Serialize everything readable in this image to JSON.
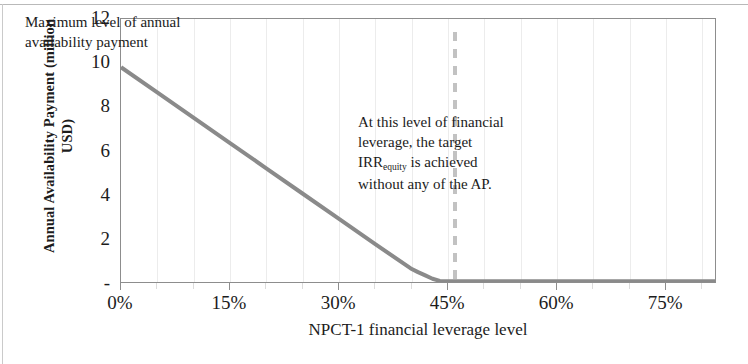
{
  "chart_data": {
    "type": "line",
    "title": "",
    "xlabel": "NPCT-1 financial leverage level",
    "ylabel": "Annual Availability Payment (million\nUSD)",
    "xlim": [
      0,
      82
    ],
    "ylim": [
      0,
      12
    ],
    "grid": true,
    "legend": "none",
    "x_tick_labels": [
      "0%",
      "15%",
      "30%",
      "45%",
      "60%",
      "75%"
    ],
    "x_tick_values": [
      0,
      15,
      30,
      45,
      60,
      75
    ],
    "y_tick_labels": [
      "12",
      "10",
      "8",
      "6",
      "4",
      "2",
      "-"
    ],
    "y_tick_values": [
      12,
      10,
      8,
      6,
      4,
      2,
      0
    ],
    "series": [
      {
        "name": "Annual availability payment",
        "color": "#8a8a8a",
        "x": [
          0,
          5,
          10,
          15,
          20,
          25,
          30,
          35,
          40,
          41,
          42,
          43,
          44,
          50,
          60,
          70,
          82
        ],
        "values": [
          9.8,
          8.65,
          7.5,
          6.35,
          5.2,
          4.05,
          2.9,
          1.75,
          0.62,
          0.45,
          0.3,
          0.15,
          0.05,
          0.03,
          0.03,
          0.03,
          0.03
        ]
      }
    ],
    "annotations": [
      {
        "id": "max-level",
        "text": "Maximum level of annual\navailability payment",
        "x": 1,
        "y": 11.2
      },
      {
        "id": "target-irr-equity",
        "text_before": "At this level of financial\nleverage, the target\n",
        "text_irr": "IRR",
        "text_sub": "equity",
        "text_after": " is achieved\nwithout any of the AP.",
        "x": 48,
        "y": 7.2
      }
    ],
    "marker_lines": [
      {
        "id": "target-leverage-marker",
        "orientation": "vertical",
        "x": 46,
        "y_from": 0,
        "y_to": 11.4,
        "style": "dashed",
        "color": "#c2c2c2"
      }
    ],
    "gridline_values": [
      5,
      10,
      15,
      20,
      25,
      30,
      35,
      40,
      45,
      50,
      55,
      60,
      65,
      70,
      75,
      80
    ],
    "colors": {
      "series": "#8a8a8a",
      "frame": "#8d8d8d",
      "grid": "#ececec",
      "marker": "#c2c2c2",
      "text": "#1c1c1c"
    }
  }
}
